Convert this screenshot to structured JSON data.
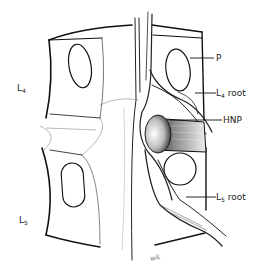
{
  "figure": {
    "vertebra_labels": [
      {
        "id": "L4",
        "base": "L",
        "sub": "4"
      },
      {
        "id": "L5",
        "base": "L",
        "sub": "5"
      }
    ],
    "callouts": [
      {
        "id": "P",
        "text": "P"
      },
      {
        "id": "L4-root",
        "base": "L",
        "sub": "4",
        "suffix": " root"
      },
      {
        "id": "HNP",
        "text": "HNP"
      },
      {
        "id": "L5-root",
        "base": "L",
        "sub": "5",
        "suffix": " root"
      }
    ],
    "signature": "wk"
  }
}
